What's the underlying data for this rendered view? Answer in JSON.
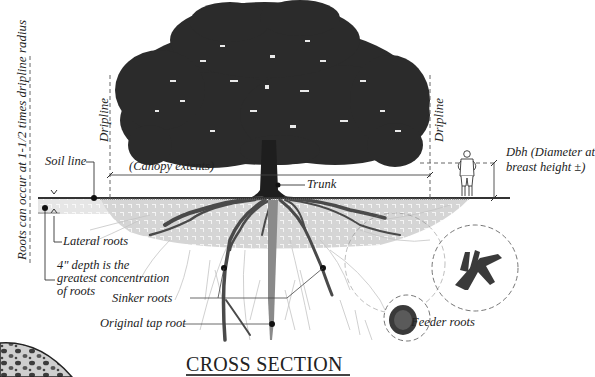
{
  "diagram": {
    "title": "CROSS SECTION",
    "labels": {
      "roots_extent": "Roots can occur at 1-1/2 times dripline radius",
      "dripline_left": "Dripline",
      "dripline_right": "Dripline",
      "soil_line": "Soil line",
      "canopy_extents": "(Canopy extents)",
      "trunk": "Trunk",
      "dbh_line1": "Dbh (Diameter at",
      "dbh_line2": "breast height ±)",
      "lateral_roots": "Lateral roots",
      "depth_line1": "4\" depth is the",
      "depth_line2": "greatest concentration",
      "depth_line3": "of roots",
      "sinker_roots": "Sinker roots",
      "original_tap_root": "Original tap root",
      "feeder_roots": "Feeder roots"
    },
    "colors": {
      "canopy": "#2b2b2b",
      "trunk": "#1e1e1e",
      "roots": "#4a4a4a",
      "tap_root": "#8a8a8a",
      "soil_hatch": "#b8b8b8",
      "fine_roots": "#c8c8c8",
      "line": "#333333"
    }
  }
}
